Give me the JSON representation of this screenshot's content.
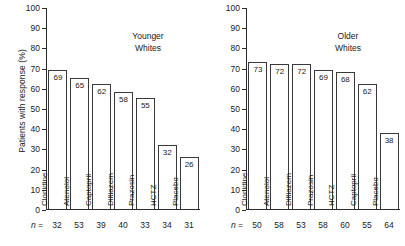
{
  "axis": {
    "ylabel": "Patients with response (%)",
    "yticks": [
      100,
      90,
      80,
      70,
      60,
      50,
      40,
      30,
      20,
      10,
      0
    ],
    "n_prefix": "n ="
  },
  "panels": [
    {
      "title_line1": "Younger",
      "title_line2": "Whites",
      "bars": [
        {
          "category": "Clonidine",
          "value": 69,
          "n": 32
        },
        {
          "category": "Atenolol",
          "value": 65,
          "n": 53
        },
        {
          "category": "Captopril",
          "value": 62,
          "n": 39
        },
        {
          "category": "Diltiazem",
          "value": 58,
          "n": 40
        },
        {
          "category": "Prazosin",
          "value": 55,
          "n": 33
        },
        {
          "category": "HCTZ",
          "value": 32,
          "n": 34
        },
        {
          "category": "Placebo",
          "value": 26,
          "n": 31
        }
      ]
    },
    {
      "title_line1": "Older",
      "title_line2": "Whites",
      "bars": [
        {
          "category": "Clonidine",
          "value": 73,
          "n": 50
        },
        {
          "category": "Atenolol",
          "value": 72,
          "n": 58
        },
        {
          "category": "Diltiazem",
          "value": 72,
          "n": 53
        },
        {
          "category": "Prazosin",
          "value": 69,
          "n": 58
        },
        {
          "category": "HCTZ",
          "value": 68,
          "n": 60
        },
        {
          "category": "Captopril",
          "value": 62,
          "n": 55
        },
        {
          "category": "Placebo",
          "value": 38,
          "n": 64
        }
      ]
    }
  ],
  "chart_data": {
    "type": "bar",
    "title": "",
    "xlabel": "",
    "ylabel": "Patients with response (%)",
    "ylim": [
      0,
      100
    ],
    "ytick_step": 10,
    "grid": false,
    "legend": "none",
    "panels": [
      {
        "name": "Younger Whites",
        "categories": [
          "Clonidine",
          "Atenolol",
          "Captopril",
          "Diltiazem",
          "Prazosin",
          "HCTZ",
          "Placebo"
        ],
        "values": [
          69,
          65,
          62,
          58,
          55,
          32,
          26
        ],
        "n": [
          32,
          53,
          39,
          40,
          33,
          34,
          31
        ]
      },
      {
        "name": "Older Whites",
        "categories": [
          "Clonidine",
          "Atenolol",
          "Diltiazem",
          "Prazosin",
          "HCTZ",
          "Captopril",
          "Placebo"
        ],
        "values": [
          73,
          72,
          72,
          69,
          68,
          62,
          38
        ],
        "n": [
          50,
          58,
          53,
          58,
          60,
          55,
          64
        ]
      }
    ]
  }
}
